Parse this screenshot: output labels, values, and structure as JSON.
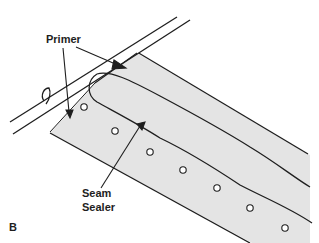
{
  "diagram": {
    "type": "technical-illustration",
    "figure_letter": "B",
    "labels": {
      "primer": "Primer",
      "seam_line1": "Seam",
      "seam_line2": "Sealer"
    },
    "colors": {
      "line": "#1e1e1e",
      "panel_fill": "#e4e4e4",
      "flange_fill": "#ffffff",
      "background": "#ffffff"
    },
    "weld_spots": [
      {
        "x": 84,
        "y": 107
      },
      {
        "x": 115,
        "y": 131
      },
      {
        "x": 150,
        "y": 152
      },
      {
        "x": 183,
        "y": 170
      },
      {
        "x": 217,
        "y": 188
      },
      {
        "x": 250,
        "y": 208
      },
      {
        "x": 285,
        "y": 228
      }
    ]
  }
}
